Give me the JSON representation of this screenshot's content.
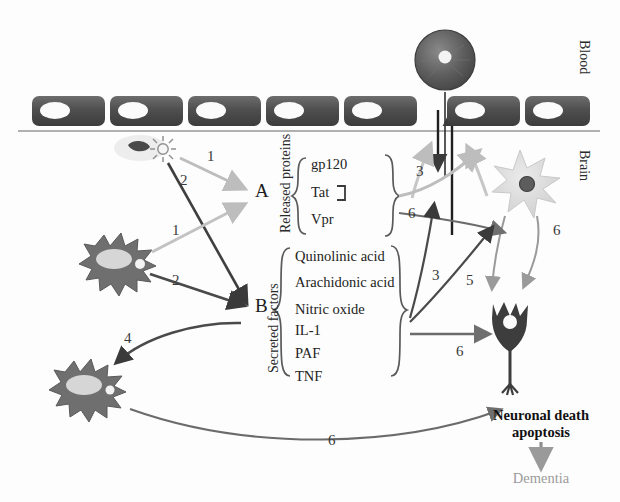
{
  "figure": {
    "background_color": "#fdfdfd"
  },
  "compartments": {
    "blood_label": "Blood",
    "brain_label": "Brain"
  },
  "nodes": {
    "a_label": "A",
    "b_label": "B"
  },
  "groups": [
    {
      "id": "released-proteins",
      "side_label": "Released proteins",
      "items": [
        "gp120",
        "Tat",
        "Vpr"
      ]
    },
    {
      "id": "secreted-factors",
      "side_label": "Secreted factors",
      "items": [
        "Quinolinic acid",
        "Arachidonic acid",
        "Nitric oxide",
        "IL-1",
        "PAF",
        "TNF"
      ]
    }
  ],
  "arrow_labels": {
    "virus_to_a": "1",
    "virus_to_b": "2",
    "microglia_to_a": "1",
    "microglia_to_b": "2",
    "proteins_to_astrocyte": "3",
    "proteins_to_barrier": "6",
    "b_to_microglia": "4",
    "factors_to_barrier": "3",
    "factors_to_astrocyte": "5",
    "factors_to_neuron": "6",
    "astrocyte_to_neuron_left": "6",
    "astrocyte_to_neuron_right": "6",
    "microglia_to_outcome": "6"
  },
  "outcome": {
    "line1": "Neuronal death",
    "line2": "apoptosis",
    "result": "Dementia"
  },
  "cells": {
    "monocyte": "monocyte",
    "virus": "hiv-virion",
    "microglia_upper": "microglia",
    "microglia_lower": "activated-microglia",
    "astrocyte": "astrocyte",
    "neuron": "neuron",
    "endothelium": "endothelial-cell-layer"
  },
  "colors": {
    "dark_arrow": "#3a3a3a",
    "light_arrow": "#b8b8b8",
    "mid_arrow": "#6f6f6f",
    "endothelium": "#4f4f4f",
    "astrocyte": "#d8d8d8",
    "neuron": "#3d3d3d",
    "microglia": "#6a6a6a",
    "dementia_text": "#9b9b9b"
  }
}
